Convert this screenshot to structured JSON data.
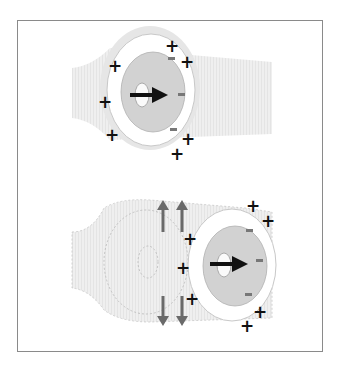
{
  "figure": {
    "panels": [
      {
        "name": "top",
        "description": "Moving charged particle in narrow channel with surrounding charge layer",
        "plus_count": 9,
        "minus_count": 3,
        "arrow": "right"
      },
      {
        "name": "bottom",
        "description": "Particle entering wider region; dashed previous position; grey arrows showing flow up and down",
        "plus_count": 9,
        "minus_count": 3,
        "arrow": "right",
        "flow_arrows": [
          "up",
          "up",
          "down",
          "down"
        ]
      }
    ],
    "symbols": {
      "plus": "+",
      "minus": "−"
    },
    "colors": {
      "frame": "#8a8a8a",
      "channel": "#ececec",
      "inner": "#d4d4d4",
      "arrow": "#111111",
      "flow_arrow": "#6a6a6a",
      "minus": "#777777"
    }
  }
}
